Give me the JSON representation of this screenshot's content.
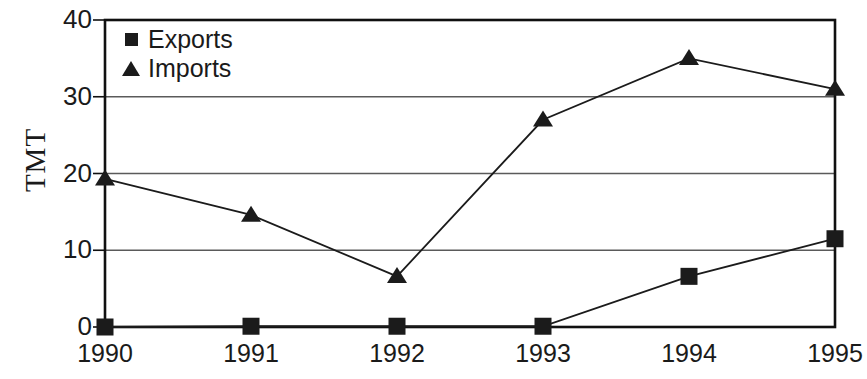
{
  "chart_data": {
    "type": "line",
    "title": "",
    "xlabel": "",
    "ylabel": "TMT",
    "categories": [
      "1990",
      "1991",
      "1992",
      "1993",
      "1994",
      "1995"
    ],
    "series": [
      {
        "name": "Exports",
        "marker": "square",
        "values": [
          0,
          0.1,
          0.1,
          0.1,
          6.6,
          11.5
        ]
      },
      {
        "name": "Imports",
        "marker": "triangle",
        "values": [
          19.3,
          14.6,
          6.6,
          27.0,
          35.0,
          31.0
        ]
      }
    ],
    "ylim": [
      0,
      40
    ],
    "y_ticks": [
      0,
      10,
      20,
      30,
      40
    ],
    "y_tick_labels": [
      "0",
      "10",
      "20",
      "30",
      "40"
    ],
    "grid": true,
    "grid_axis": "y",
    "legend_position": "top-left-inside",
    "colors": {
      "series_exports": "#1b1b1b",
      "series_imports": "#1b1b1b",
      "grid": "#5a5a5a",
      "axis": "#101010",
      "background": "#ffffff"
    }
  },
  "legend": {
    "entries": [
      {
        "label": "Exports",
        "marker": "square"
      },
      {
        "label": "Imports",
        "marker": "triangle"
      }
    ]
  },
  "axes": {
    "y_title": "TMT"
  }
}
